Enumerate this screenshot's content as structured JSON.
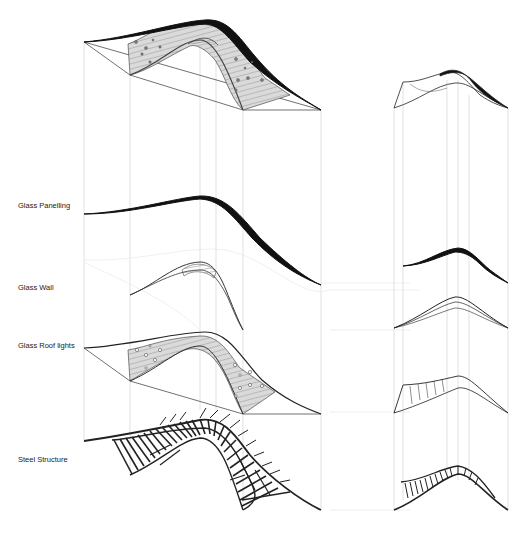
{
  "layers": [
    {
      "id": "glass-panelling",
      "label": "Glass Panelling",
      "label_y": 205
    },
    {
      "id": "glass-wall",
      "label": "Glass Wall",
      "label_y": 287
    },
    {
      "id": "glass-roof-lights",
      "label": "Glass Roof lights",
      "label_y": 344
    },
    {
      "id": "steel-structure",
      "label": "Steel Structure",
      "label_y": 455
    }
  ],
  "views": [
    "axonometric-exploded",
    "elevation-exploded"
  ],
  "colors": {
    "ink": "#111111",
    "guide": "#cfcfcf",
    "fill": "#d8d8d8"
  }
}
